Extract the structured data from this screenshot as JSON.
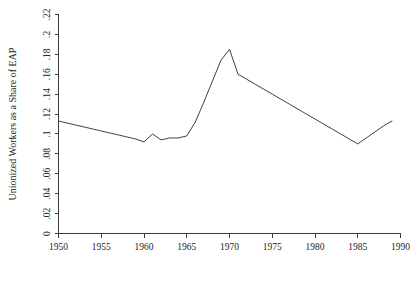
{
  "chart_data": {
    "type": "line",
    "title": "",
    "xlabel": "",
    "ylabel": "Unionized Workers as a Share of EAP",
    "xlim": [
      1950,
      1990
    ],
    "ylim": [
      0,
      0.22
    ],
    "grid": false,
    "legend": null,
    "x_ticks": [
      1950,
      1955,
      1960,
      1965,
      1970,
      1975,
      1980,
      1985,
      1990
    ],
    "x_tick_labels": [
      "1950",
      "1955",
      "1960",
      "1965",
      "1970",
      "1975",
      "1980",
      "1985",
      "1990"
    ],
    "y_ticks": [
      0,
      0.02,
      0.04,
      0.06,
      0.08,
      0.1,
      0.12,
      0.14,
      0.16,
      0.18,
      0.2,
      0.22
    ],
    "y_tick_labels": [
      "0",
      ".02",
      ".04",
      ".06",
      ".08",
      ".1",
      ".12",
      ".14",
      ".16",
      ".18",
      ".2",
      ".22"
    ],
    "line_color": "#404040",
    "series": [
      {
        "name": "Unionized Workers as a Share of EAP",
        "x": [
          1950,
          1951,
          1952,
          1953,
          1954,
          1955,
          1956,
          1957,
          1958,
          1959,
          1960,
          1961,
          1962,
          1963,
          1964,
          1965,
          1966,
          1967,
          1968,
          1969,
          1970,
          1971,
          1972,
          1973,
          1974,
          1975,
          1976,
          1977,
          1978,
          1979,
          1980,
          1981,
          1982,
          1983,
          1984,
          1985,
          1986,
          1987,
          1988,
          1989
        ],
        "values": [
          0.113,
          0.111,
          0.109,
          0.107,
          0.105,
          0.103,
          0.101,
          0.099,
          0.097,
          0.095,
          0.092,
          0.1,
          0.094,
          0.096,
          0.096,
          0.098,
          0.112,
          0.132,
          0.153,
          0.174,
          0.185,
          0.16,
          0.155,
          0.15,
          0.145,
          0.14,
          0.135,
          0.13,
          0.125,
          0.12,
          0.115,
          0.11,
          0.105,
          0.1,
          0.095,
          0.09,
          0.096,
          0.102,
          0.108,
          0.113
        ]
      }
    ],
    "annotations": []
  }
}
